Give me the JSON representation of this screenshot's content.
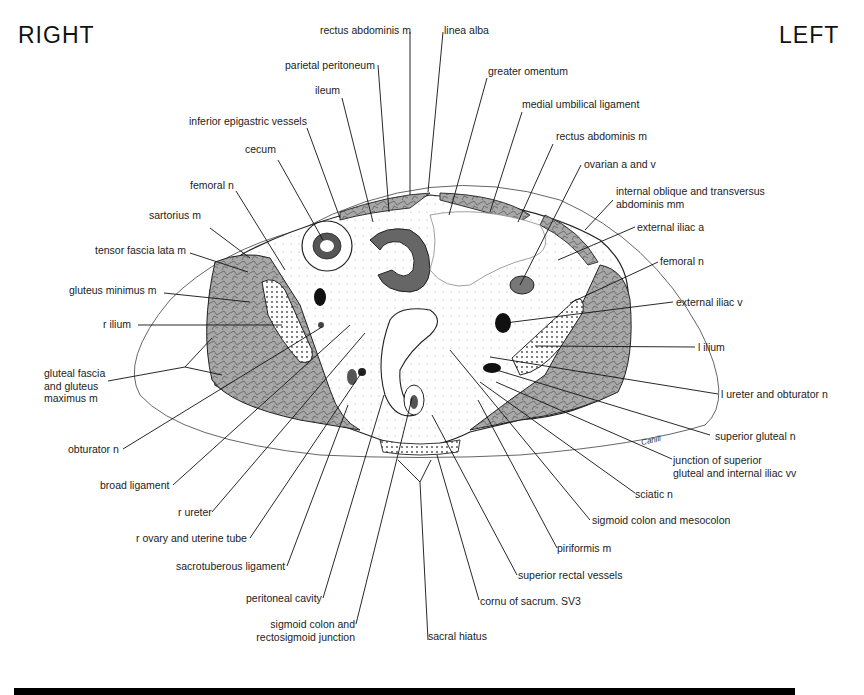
{
  "orientation": {
    "right": "RIGHT",
    "left": "LEFT"
  },
  "signature": "Cahill",
  "labels": {
    "rectus_abdominis_top": "rectus abdominis m",
    "linea_alba": "linea alba",
    "parietal_peritoneum": "parietal peritoneum",
    "greater_omentum": "greater omentum",
    "ileum": "ileum",
    "medial_umbilical_ligament": "medial umbilical ligament",
    "inferior_epigastric_vessels": "inferior epigastric vessels",
    "rectus_abdominis_left": "rectus abdominis m",
    "cecum": "cecum",
    "ovarian_a_v": "ovarian a and v",
    "femoral_n_right": "femoral n",
    "internal_oblique": "internal oblique and transversus\nabdominis mm",
    "sartorius": "sartorius m",
    "external_iliac_a": "external iliac a",
    "tensor_fascia_lata": "tensor fascia lata m",
    "femoral_n_left": "femoral n",
    "gluteus_minimus": "gluteus minimus m",
    "external_iliac_v": "external iliac v",
    "r_ilium": "r ilium",
    "l_ilium": "l ilium",
    "gluteal_fascia": "gluteal fascia\nand gluteus\nmaximus m",
    "l_ureter_obturator": "l ureter and obturator n",
    "obturator_n": "obturator n",
    "superior_gluteal_n": "superior gluteal n",
    "junction_superior_gluteal": "junction of superior\ngluteal and internal iliac vv",
    "broad_ligament": "broad ligament",
    "sciatic_n": "sciatic n",
    "r_ureter": "r ureter",
    "sigmoid_mesocolon": "sigmoid colon and mesocolon",
    "r_ovary_uterine_tube": "r ovary and uterine tube",
    "piriformis": "piriformis m",
    "sacrotuberous_ligament": "sacrotuberous ligament",
    "superior_rectal_vessels": "superior rectal vessels",
    "peritoneal_cavity": "peritoneal cavity",
    "cornu_sacrum": "cornu of sacrum. SV3",
    "sigmoid_rectosigmoid": "sigmoid colon and\nrectosigmoid junction",
    "sacral_hiatus": "sacral hiatus"
  },
  "colors": {
    "ink": "#1a1a1a",
    "muscle_fill": "#9a9a9a",
    "background": "#ffffff",
    "footer_bar": "#000000"
  }
}
